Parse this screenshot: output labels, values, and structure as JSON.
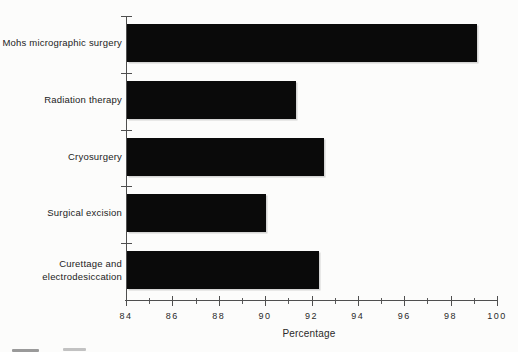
{
  "figure": {
    "background_color": "#fcfcfb",
    "bar_color": "#0a0a0a",
    "axis_color": "#4f4f4f",
    "text_color": "#222222"
  },
  "chart_data": {
    "type": "bar",
    "orientation": "horizontal",
    "title": "",
    "xlabel": "Percentage",
    "ylabel": "",
    "xlim": [
      84,
      100
    ],
    "categories": [
      "Mohs micrographic surgery",
      "Radiation therapy",
      "Cryosurgery",
      "Surgical excision",
      "Curettage and electrodesiccation"
    ],
    "display_labels": [
      "Mohs micrographic surgery",
      "Radiation therapy",
      "Cryosurgery",
      "Surgical excision",
      "Curettage and\nelectrodesiccation"
    ],
    "values": [
      99.1,
      91.3,
      92.5,
      90.0,
      92.3
    ],
    "x_major_ticks": [
      84,
      86,
      88,
      90,
      92,
      94,
      96,
      98,
      100
    ],
    "x_minor_ticks": [
      85,
      87,
      89,
      91,
      93,
      95,
      97,
      99
    ],
    "grid": false,
    "legend": false
  }
}
